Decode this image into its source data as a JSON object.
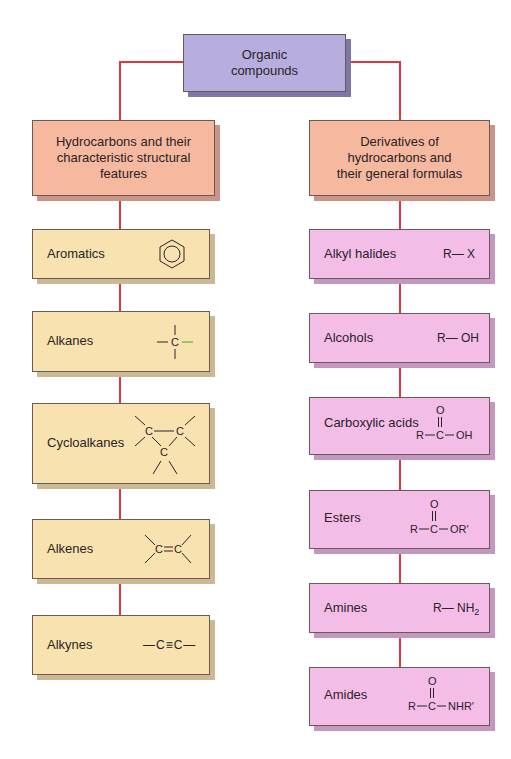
{
  "root": {
    "label_line1": "Organic",
    "label_line2": "compounds",
    "color": "#b7aedf"
  },
  "connector_color": "#e0363f",
  "left_branch": {
    "header": {
      "line1": "Hydrocarbons and their",
      "line2": "characteristic structural",
      "line3": "features",
      "color": "#f6b9a0"
    },
    "item_color": "#f8e3b0",
    "items": [
      {
        "label": "Aromatics",
        "structure": "benzene-ring"
      },
      {
        "label": "Alkanes",
        "structure": "C single bonds",
        "c": "C"
      },
      {
        "label": "Cycloalkanes",
        "structure": "cyclopropane",
        "c": "C"
      },
      {
        "label": "Alkenes",
        "structure": "C=C",
        "c": "C"
      },
      {
        "label": "Alkynes",
        "structure": "—C≡C—"
      }
    ]
  },
  "right_branch": {
    "header": {
      "line1": "Derivatives of",
      "line2": "hydrocarbons and",
      "line3": "their general formulas",
      "color": "#f6b9a0"
    },
    "item_color": "#f4bde8",
    "items": [
      {
        "label": "Alkyl halides",
        "formula": "R— X"
      },
      {
        "label": "Alcohols",
        "formula": "R— OH"
      },
      {
        "label": "Carboxylic acids",
        "formula_top": "O",
        "formula": "R—C—OH",
        "r": "R",
        "c": "C",
        "tail": "OH"
      },
      {
        "label": "Esters",
        "formula_top": "O",
        "formula": "R—C—OR′",
        "r": "R",
        "c": "C",
        "tail": "OR′"
      },
      {
        "label": "Amines",
        "formula_base": "R— NH",
        "formula_sub": "2"
      },
      {
        "label": "Amides",
        "formula_top": "O",
        "formula": "R—C—NHR′",
        "r": "R",
        "c": "C",
        "tail": "NHR′"
      }
    ]
  }
}
